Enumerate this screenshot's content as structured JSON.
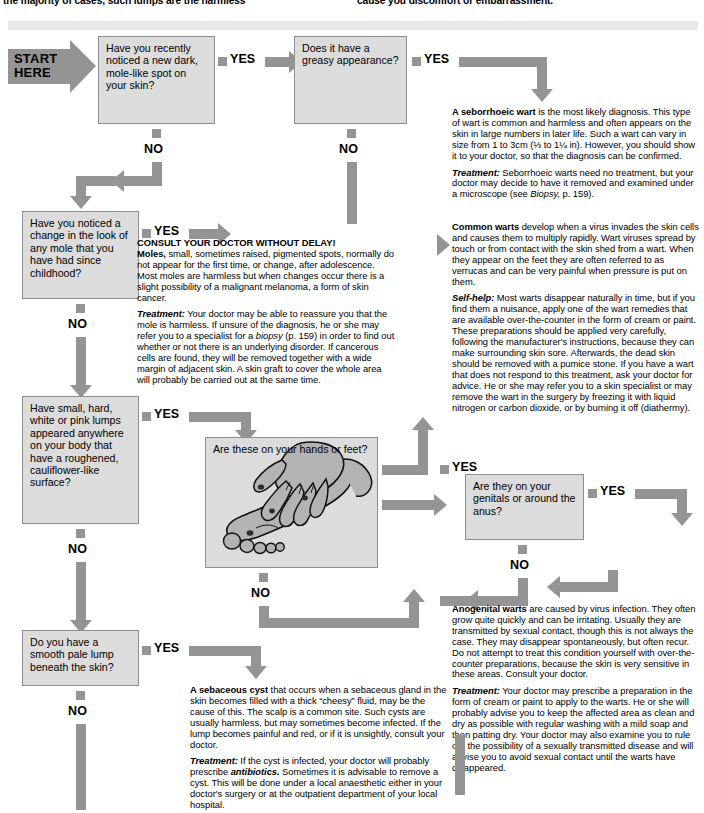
{
  "intro": {
    "left_text": "the majority of cases, such lumps are the harmless",
    "right_text": "cause you discomfort or embarrassment."
  },
  "start": {
    "line1": "START",
    "line2": "HERE"
  },
  "answers": {
    "yes": "YES",
    "no": "NO"
  },
  "questions": [
    {
      "id": "q1",
      "text": "Have you recently noticed a new dark, mole-like spot on your skin?"
    },
    {
      "id": "q2",
      "text": "Does it have a greasy appearance?"
    },
    {
      "id": "q3",
      "text": "Have you noticed a change in the look of any mole that you have had since childhood?"
    },
    {
      "id": "q4",
      "text": "Have small, hard, white or pink lumps appeared anywhere on your body that have a roughened, cauliflower-like surface?"
    },
    {
      "id": "q5",
      "text": "Are these on your hands or feet?"
    },
    {
      "id": "q6",
      "text": "Are they on your genitals or around the anus?"
    },
    {
      "id": "q7",
      "text": "Do you have a smooth pale lump beneath the skin?"
    }
  ],
  "advice": {
    "seborrhoeic": {
      "lead": "A seborrhoeic wart",
      "body": " is the most likely diagnosis. This type of wart is common and harmless and often appears on the skin in large numbers in later life. Such a wart can vary in size from 1 to 3cm (⅓ to 1¼ in). However, you should show it to your doctor, so that the diagnosis can be confirmed.",
      "treatment_label": "Treatment:",
      "treatment_body": " Seborrhoeic warts need no treatment, but your doctor may decide to have it removed and examined under a microscope (see ",
      "treatment_ref": "Biopsy,",
      "treatment_tail": " p. 159)."
    },
    "moles": {
      "shout": "CONSULT YOUR DOCTOR WITHOUT DELAY!",
      "lead": "Moles,",
      "body": " small, sometimes raised, pigmented spots, normally do not appear for the first time, or change, after adolescence. Most moles are harmless but when changes occur there is a slight possibility of a malignant melanoma, a form of skin cancer.",
      "treatment_label": "Treatment:",
      "treatment_body": " Your doctor may be able to reassure you that the mole is harmless. If unsure of the diagnosis, he or she may refer you to a specialist for a ",
      "treatment_ref": "biopsy",
      "treatment_tail": " (p. 159) in order to find out whether or not there is an underlying disorder. If cancerous cells are found, they will be removed together with a wide margin of adjacent skin. A skin graft to cover the whole area will probably be carried out at the same time."
    },
    "common_warts": {
      "lead": "Common warts",
      "body": " develop when a virus invades the skin cells and causes them to multiply rapidly. Wart viruses spread by touch or from contact with the skin shed from a wart. When they appear on the feet they are often referred to as verrucas and can be very painful when pressure is put on them.",
      "treatment_label": "Self-help:",
      "treatment_body": " Most warts disappear naturally in time, but if you find them a nuisance, apply one of the wart remedies that are available over-the-counter in the form of cream or paint. These preparations should be applied very carefully, following the manufacturer's instructions, because they can make surrounding skin sore. Afterwards, the dead skin should be removed with a pumice stone. If you have a wart that does not respond to this treatment, ask your doctor for advice. He or she may refer you to a skin specialist or may remove the wart in the surgery by freezing it with liquid nitrogen or carbon dioxide, or by burning it off (diathermy)."
    },
    "anogenital": {
      "lead": "Anogenital warts",
      "body": " are caused by virus infection. They often grow quite quickly and can be irritating. Usually they are transmitted by sexual contact, though this is not always the case. They may disappear spontaneously, but often recur. Do not attempt to treat this condition yourself with over-the-counter preparations, because the skin is very sensitive in these areas. Consult your doctor.",
      "treatment_label": "Treatment:",
      "treatment_body": " Your doctor may prescribe a preparation in the form of cream or paint to apply to the warts. He or she will probably advise you to keep the affected area as clean and dry as possible with regular washing with a mild soap and then patting dry. Your doctor may also examine you to rule out the possibility of a sexually transmitted disease and will advise you to avoid sexual contact until the warts have disappeared."
    },
    "sebaceous": {
      "lead": "A sebaceous cyst",
      "body": " that occurs when a sebaceous gland in the skin becomes filled with a thick “cheesy” fluid, may be the cause of this. The scalp is a common site. Such cysts are usually harmless, but may sometimes become infected. If the lump becomes painful and red, or if it is unsightly, consult your doctor.",
      "treatment_label": "Treatment:",
      "treatment_body": " If the cyst is infected, your doctor will probably prescribe ",
      "treatment_ref": "antibiotics.",
      "treatment_tail": " Sometimes it is advisable to remove a cyst. This will be done under a local anaesthetic either in your doctor's surgery or at the outpatient department of your local hospital."
    }
  },
  "colors": {
    "connector": "#949494",
    "box_fill": "#dcdcdc",
    "box_border": "#8e8e8e",
    "skin": "#b9b9b9",
    "page": "#ffffff"
  }
}
